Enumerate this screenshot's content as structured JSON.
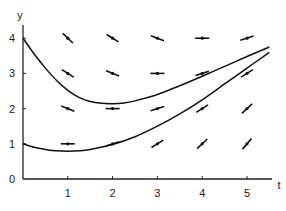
{
  "chart_data": {
    "type": "line",
    "title": "",
    "xlabel": "t",
    "ylabel": "y",
    "xlim": [
      0,
      5.6
    ],
    "ylim": [
      0,
      4.2
    ],
    "xticks": [
      1,
      2,
      3,
      4,
      5
    ],
    "yticks": [
      0,
      1,
      2,
      3,
      4
    ],
    "grid": false,
    "legend": null,
    "slope_field": {
      "description": "Direction field segments",
      "points": [
        {
          "t": 1,
          "y": 4,
          "slope": -1.2
        },
        {
          "t": 2,
          "y": 4,
          "slope": -0.8
        },
        {
          "t": 3,
          "y": 4,
          "slope": -0.5
        },
        {
          "t": 4,
          "y": 4,
          "slope": 0
        },
        {
          "t": 5,
          "y": 4,
          "slope": 0.4
        },
        {
          "t": 1,
          "y": 3,
          "slope": -0.8
        },
        {
          "t": 2,
          "y": 3,
          "slope": -0.5
        },
        {
          "t": 3,
          "y": 3,
          "slope": 0
        },
        {
          "t": 4,
          "y": 3,
          "slope": 0.4
        },
        {
          "t": 5,
          "y": 3,
          "slope": 0.8
        },
        {
          "t": 1,
          "y": 2,
          "slope": -0.5
        },
        {
          "t": 2,
          "y": 2,
          "slope": 0
        },
        {
          "t": 3,
          "y": 2,
          "slope": 0.4
        },
        {
          "t": 4,
          "y": 2,
          "slope": 0.8
        },
        {
          "t": 5,
          "y": 2,
          "slope": 1.2
        },
        {
          "t": 1,
          "y": 1,
          "slope": 0
        },
        {
          "t": 2,
          "y": 1,
          "slope": 0.4
        },
        {
          "t": 3,
          "y": 1,
          "slope": 0.8
        },
        {
          "t": 4,
          "y": 1,
          "slope": 1.2
        },
        {
          "t": 5,
          "y": 1,
          "slope": 1.5
        }
      ]
    },
    "series": [
      {
        "name": "solution y(0)=4",
        "x": [
          0,
          0.25,
          0.5,
          0.75,
          1.0,
          1.25,
          1.5,
          1.75,
          2.0,
          2.25,
          2.5,
          3.0,
          3.5,
          4.0,
          4.5,
          5.0,
          5.5
        ],
        "values": [
          4.0,
          3.55,
          3.15,
          2.8,
          2.52,
          2.32,
          2.2,
          2.15,
          2.14,
          2.16,
          2.22,
          2.4,
          2.65,
          2.92,
          3.2,
          3.48,
          3.75
        ]
      },
      {
        "name": "solution y(0)=1",
        "x": [
          0,
          0.25,
          0.5,
          0.75,
          1.0,
          1.25,
          1.5,
          2.0,
          2.5,
          3.0,
          3.5,
          4.0,
          4.5,
          5.0,
          5.5
        ],
        "values": [
          1.0,
          0.9,
          0.84,
          0.8,
          0.79,
          0.8,
          0.84,
          0.98,
          1.2,
          1.5,
          1.85,
          2.25,
          2.7,
          3.15,
          3.6
        ]
      }
    ]
  },
  "axes": {
    "x_label": "t",
    "y_label": "y",
    "x_tick_labels": [
      "1",
      "2",
      "3",
      "4",
      "5"
    ],
    "y_tick_labels": [
      "0",
      "1",
      "2",
      "3",
      "4"
    ]
  }
}
